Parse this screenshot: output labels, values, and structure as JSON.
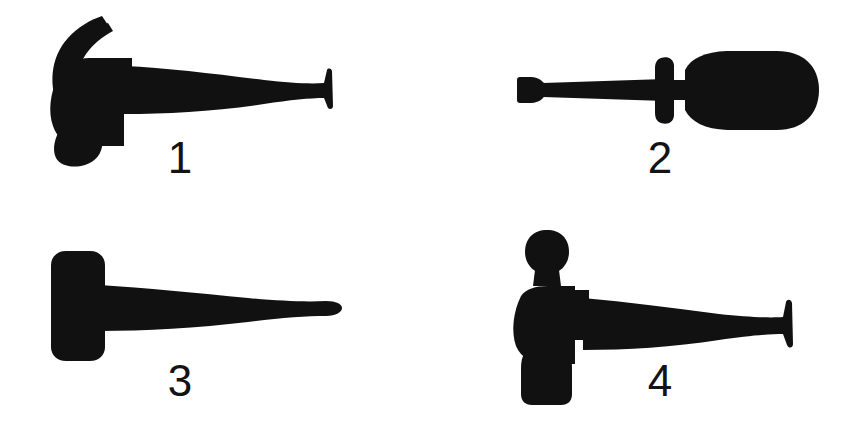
{
  "figure": {
    "background_color": "#ffffff",
    "silhouette_color": "#111111",
    "width": 841,
    "height": 423,
    "layout": "2x2 grid of labelled black silhouettes on plain white background"
  },
  "items": [
    {
      "number": "1",
      "name": "claw-hammer",
      "description": "Claw hammer silhouette facing left, curved split claw, rounded striking face, long flaring wooden handle to the right",
      "orientation": "head-left",
      "position": "top-left"
    },
    {
      "number": "2",
      "name": "flathead-screwdriver",
      "description": "Flat-blade screwdriver silhouette, wedge tip at left, straight shaft, collar ferrule, bulbous rounded handle at right",
      "orientation": "tip-left",
      "position": "top-right"
    },
    {
      "number": "3",
      "name": "club-hammer",
      "description": "Club or sledge hammer silhouette, rectangular rounded head at left, tapered handle with rounded end at right",
      "orientation": "head-left",
      "position": "bottom-left"
    },
    {
      "number": "4",
      "name": "ball-peen-hammer",
      "description": "Ball-peen hammer silhouette, rounded ball peen on top, waisted neck, square striking face below, long flaring handle to the right",
      "orientation": "head-left",
      "position": "bottom-right"
    }
  ]
}
